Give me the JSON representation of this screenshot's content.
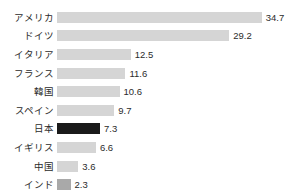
{
  "chart_data": {
    "type": "bar",
    "orientation": "horizontal",
    "title": "",
    "subtitle": "",
    "xlabel": "",
    "ylabel": "",
    "grid": false,
    "legend": null,
    "xlim": [
      0,
      34.7
    ],
    "categories": [
      "アメリカ",
      "ドイツ",
      "イタリア",
      "フランス",
      "韓国",
      "スペイン",
      "日本",
      "イギリス",
      "中国",
      "インド"
    ],
    "values": [
      34.7,
      29.2,
      12.5,
      11.6,
      10.6,
      9.7,
      7.3,
      6.6,
      3.6,
      2.3
    ],
    "value_labels": [
      "34.7",
      "29.2",
      "12.5",
      "11.6",
      "10.6",
      "9.7",
      "7.3",
      "6.6",
      "3.6",
      "2.3"
    ],
    "bar_styles": [
      "normal",
      "normal",
      "normal",
      "normal",
      "normal",
      "normal",
      "highlight",
      "normal",
      "normal",
      "accent"
    ],
    "colors": {
      "bar_default": "#d5d5d5",
      "bar_highlight": "#1a1a1a",
      "bar_accent": "#a9a9a9",
      "text": "#2b2b2b",
      "background": "#ffffff"
    },
    "px_per_unit": 5.9,
    "rows": [
      {
        "label": "アメリカ",
        "value": 34.7,
        "value_label": "34.7",
        "style": "normal"
      },
      {
        "label": "ドイツ",
        "value": 29.2,
        "value_label": "29.2",
        "style": "normal"
      },
      {
        "label": "イタリア",
        "value": 12.5,
        "value_label": "12.5",
        "style": "normal"
      },
      {
        "label": "フランス",
        "value": 11.6,
        "value_label": "11.6",
        "style": "normal"
      },
      {
        "label": "韓国",
        "value": 10.6,
        "value_label": "10.6",
        "style": "normal"
      },
      {
        "label": "スペイン",
        "value": 9.7,
        "value_label": "9.7",
        "style": "normal"
      },
      {
        "label": "日本",
        "value": 7.3,
        "value_label": "7.3",
        "style": "highlight"
      },
      {
        "label": "イギリス",
        "value": 6.6,
        "value_label": "6.6",
        "style": "normal"
      },
      {
        "label": "中国",
        "value": 3.6,
        "value_label": "3.6",
        "style": "normal"
      },
      {
        "label": "インド",
        "value": 2.3,
        "value_label": "2.3",
        "style": "accent"
      }
    ]
  }
}
